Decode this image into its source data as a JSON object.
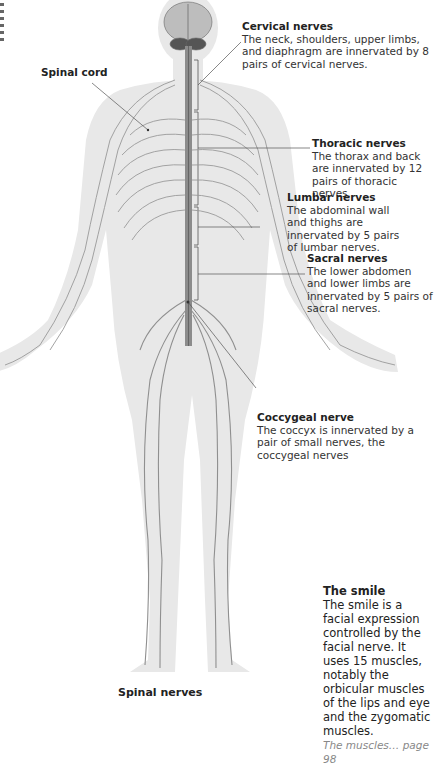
{
  "figure": {
    "caption": "Spinal nerves",
    "colors": {
      "skin": "#e6e6e6",
      "nerve": "#8a8a8a",
      "spine": "#777777",
      "leader": "#555555"
    }
  },
  "labels": {
    "spinal_cord": "Spinal cord",
    "cervical": {
      "title": "Cervical nerves",
      "body": "The neck, shoulders, upper limbs, and diaphragm are innervated by 8 pairs of cervical nerves."
    },
    "thoracic": {
      "title": "Thoracic nerves",
      "body": "The thorax and back are innervated by 12 pairs of thoracic nerves."
    },
    "lumbar": {
      "title": "Lumbar nerves",
      "body": "The abdominal wall and thighs are innervated by 5 pairs of lumbar nerves."
    },
    "sacral": {
      "title": "Sacral nerves",
      "body": "The lower abdomen and lower limbs are innervated by 5 pairs of sacral nerves."
    },
    "coccygeal": {
      "title": "Coccygeal nerve",
      "body": "The coccyx is innervated by a pair of small nerves, the coccygeal nerves"
    }
  },
  "sidebar_note": {
    "title": "The smile",
    "body": "The smile is a facial expression controlled by the facial nerve. It uses 15 muscles, notably the orbicular muscles of the lips and eye and the zygomatic muscles.",
    "xref": "The muscles… page 98"
  }
}
